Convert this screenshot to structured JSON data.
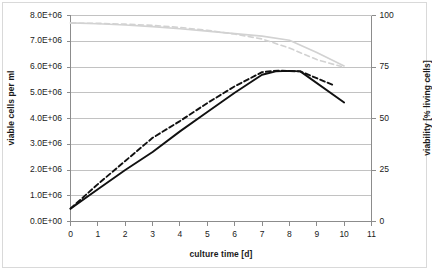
{
  "chart_data": {
    "type": "line",
    "title": "",
    "xlabel": "culture time [d]",
    "ylabel": "viable cells per ml",
    "y2label": "viability [% living cells]",
    "xlim": [
      0,
      11
    ],
    "ylim": [
      0,
      8000000
    ],
    "y2lim": [
      0,
      100
    ],
    "grid": true,
    "legend": "none",
    "x_ticks": [
      "0",
      "1",
      "2",
      "3",
      "4",
      "5",
      "6",
      "7",
      "8",
      "9",
      "10",
      "11"
    ],
    "y_ticks": [
      "0.0E+00",
      "1.0E+06",
      "2.0E+06",
      "3.0E+06",
      "4.0E+06",
      "5.0E+06",
      "6.0E+06",
      "7.0E+06",
      "8.0E+06"
    ],
    "y2_ticks": [
      "0",
      "25",
      "50",
      "75",
      "100"
    ],
    "colors": {
      "cells": "#111111",
      "viability": "#d2d2d2",
      "grid": "#b3b3b3",
      "axis": "#8c8c8c",
      "border": "#d9d9d9"
    },
    "series": [
      {
        "name": "viable cells per ml - run 1",
        "axis": "left",
        "style": "solid",
        "color": "#111111",
        "x": [
          0,
          1,
          2,
          3,
          4,
          5,
          6,
          7,
          7.5,
          8,
          8.4,
          10
        ],
        "values": [
          500000,
          1250000,
          2000000,
          2700000,
          3500000,
          4250000,
          5000000,
          5700000,
          5830000,
          5850000,
          5830000,
          4620000
        ]
      },
      {
        "name": "viable cells per ml - run 2",
        "axis": "left",
        "style": "dashed",
        "color": "#111111",
        "x": [
          0,
          1,
          2,
          3,
          4,
          5,
          6,
          7,
          7.6,
          8.4,
          9.6
        ],
        "values": [
          500000,
          1450000,
          2350000,
          3250000,
          3900000,
          4600000,
          5250000,
          5800000,
          5860000,
          5830000,
          5300000
        ]
      },
      {
        "name": "viability - run 1",
        "axis": "right",
        "style": "solid",
        "color": "#d2d2d2",
        "x": [
          0,
          1,
          2,
          3,
          4,
          5,
          6,
          7,
          8,
          9,
          10
        ],
        "values": [
          96.4,
          96.0,
          95.4,
          94.6,
          93.6,
          92.4,
          91.2,
          90.0,
          88.0,
          82.0,
          75.5
        ]
      },
      {
        "name": "viability - run 2",
        "axis": "right",
        "style": "dashed",
        "color": "#d2d2d2",
        "x": [
          0,
          1,
          2,
          3,
          4,
          5,
          6,
          7,
          8,
          9,
          9.9
        ],
        "values": [
          96.3,
          96.2,
          95.8,
          95.2,
          94.2,
          92.8,
          91.0,
          88.6,
          84.2,
          78.6,
          75.2
        ]
      }
    ]
  },
  "axes": {
    "x_title": "culture time [d]",
    "y_left_title": "viable cells per ml",
    "y_right_title": "viability [% living cells]"
  }
}
